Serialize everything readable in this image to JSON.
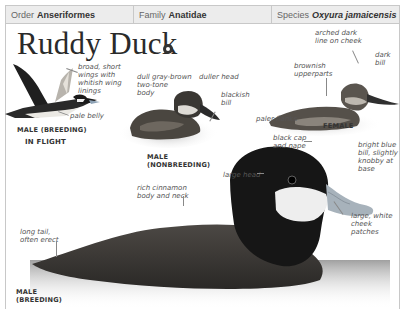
{
  "taxonomy": {
    "order": {
      "label": "Order",
      "value": "Anseriformes"
    },
    "family": {
      "label": "Family",
      "value": "Anatidae"
    },
    "species": {
      "label": "Species",
      "value": "Oxyura jamaicensis"
    }
  },
  "title": "Ruddy Duck",
  "audio_icon": "speaker-icon",
  "figures": {
    "flight": {
      "caption_line1": "MALE (BREEDING)",
      "caption_line2": "IN FLIGHT",
      "annotations": {
        "wings": "broad, short\nwings with\nwhitish wing\nlinings",
        "belly": "pale belly"
      }
    },
    "nonbreeding": {
      "caption": "MALE\n(NONBREEDING)",
      "annotations": {
        "body": "dull gray-brown\ntwo-tone\nbody",
        "head": "duller head",
        "bill": "blackish\nbill"
      }
    },
    "female": {
      "caption": "FEMALE",
      "annotations": {
        "cheek": "arched dark\nline on cheek",
        "bill": "dark\nbill",
        "upperparts": "brownish\nupperparts",
        "flanks": "paler flanks"
      }
    },
    "breeding": {
      "caption": "MALE\n(BREEDING)",
      "annotations": {
        "cap": "black cap\nand nape",
        "bill": "bright blue\nbill, slightly\nknobby at\nbase",
        "head": "large head",
        "body": "rich cinnamon\nbody and neck",
        "cheek": "large, white\ncheek\npatches",
        "tail": "long tail,\noften erect"
      }
    }
  }
}
